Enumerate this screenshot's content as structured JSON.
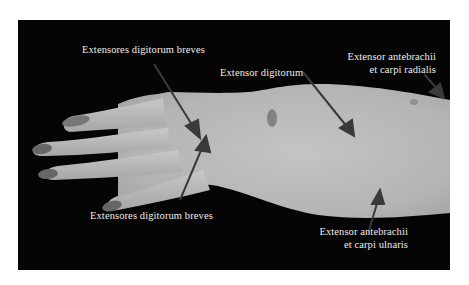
{
  "figure": {
    "colors": {
      "background": "#050505",
      "tissue": "#b8b8b8",
      "arrow": "#3a3a3a",
      "label_text": "#ececec"
    },
    "labels": [
      {
        "id": "edb_top",
        "text": "Extensores digitorum breves"
      },
      {
        "id": "ed",
        "text": "Extensor digitorum"
      },
      {
        "id": "eacr",
        "line1": "Extensor antebrachii",
        "line2": "et carpi radialis"
      },
      {
        "id": "edb_bottom",
        "text": "Extensores digitorum breves"
      },
      {
        "id": "eacu",
        "line1": "Extensor antebrachii",
        "line2": "et carpi ulnaris"
      }
    ]
  }
}
